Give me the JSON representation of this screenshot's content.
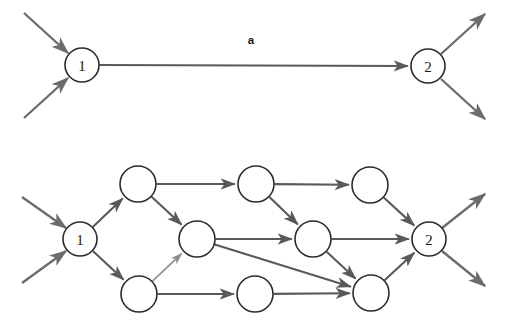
{
  "figure": {
    "background_color": "#ffffff",
    "node_stroke_color": "#2b2b2b",
    "edge_color": "#595959",
    "external_edge_color": "#6b6b6b",
    "faded_edge_color": "#8f8f8f",
    "label_color": "#1a1a1a"
  },
  "panels": [
    {
      "id": "top-panel",
      "name": "coarse-graph",
      "nodes": [
        {
          "id": "t1",
          "label": "1",
          "cx": 82,
          "cy": 65,
          "r": 17
        },
        {
          "id": "t2",
          "label": "2",
          "cx": 428,
          "cy": 66,
          "r": 17
        }
      ],
      "edges": [
        {
          "id": "t-a",
          "from": "t1",
          "to": "t2",
          "label": "a",
          "label_x": 251,
          "label_y": 44,
          "kind": "internal"
        }
      ],
      "external_in": [
        {
          "id": "t-in-1",
          "x1": 24,
          "y1": 13,
          "x2": 68,
          "y2": 53
        },
        {
          "id": "t-in-2",
          "x1": 24,
          "y1": 118,
          "x2": 68,
          "y2": 78
        }
      ],
      "external_out": [
        {
          "id": "t-out-1",
          "x1": 441,
          "y1": 54,
          "x2": 485,
          "y2": 14
        },
        {
          "id": "t-out-2",
          "x1": 441,
          "y1": 79,
          "x2": 485,
          "y2": 119
        }
      ]
    },
    {
      "id": "bottom-panel",
      "name": "refined-graph",
      "nodes": [
        {
          "id": "b1",
          "label": "1",
          "cx": 80,
          "cy": 239,
          "r": 17
        },
        {
          "id": "bu1",
          "label": "",
          "cx": 138,
          "cy": 184,
          "r": 18
        },
        {
          "id": "bu2",
          "label": "",
          "cx": 256,
          "cy": 184,
          "r": 18
        },
        {
          "id": "bu3",
          "label": "",
          "cx": 370,
          "cy": 185,
          "r": 18
        },
        {
          "id": "bm1",
          "label": "",
          "cx": 197,
          "cy": 239,
          "r": 18
        },
        {
          "id": "bm2",
          "label": "",
          "cx": 313,
          "cy": 239,
          "r": 18
        },
        {
          "id": "bl1",
          "label": "",
          "cx": 139,
          "cy": 294,
          "r": 18
        },
        {
          "id": "bl2",
          "label": "",
          "cx": 255,
          "cy": 294,
          "r": 18
        },
        {
          "id": "bl3",
          "label": "",
          "cx": 371,
          "cy": 293,
          "r": 18
        },
        {
          "id": "b2",
          "label": "2",
          "cx": 429,
          "cy": 239,
          "r": 17
        }
      ],
      "edges": [
        {
          "id": "e1",
          "from": "b1",
          "to": "bu1",
          "kind": "internal"
        },
        {
          "id": "e2",
          "from": "b1",
          "to": "bl1",
          "kind": "internal"
        },
        {
          "id": "e3",
          "from": "bu1",
          "to": "bu2",
          "kind": "internal"
        },
        {
          "id": "e4",
          "from": "bu1",
          "to": "bm1",
          "kind": "internal"
        },
        {
          "id": "e5",
          "from": "bu2",
          "to": "bu3",
          "kind": "internal"
        },
        {
          "id": "e6",
          "from": "bu2",
          "to": "bm2",
          "kind": "internal"
        },
        {
          "id": "e7",
          "from": "bu3",
          "to": "b2",
          "kind": "internal"
        },
        {
          "id": "e8",
          "from": "bm1",
          "to": "bm2",
          "kind": "internal"
        },
        {
          "id": "e9",
          "from": "bm1",
          "to": "bl3",
          "kind": "internal"
        },
        {
          "id": "e10",
          "from": "bm2",
          "to": "b2",
          "kind": "internal"
        },
        {
          "id": "e11",
          "from": "bm2",
          "to": "bl3",
          "kind": "internal"
        },
        {
          "id": "e12",
          "from": "bl1",
          "to": "bm1",
          "kind": "faded"
        },
        {
          "id": "e13",
          "from": "bl1",
          "to": "bl2",
          "kind": "internal"
        },
        {
          "id": "e14",
          "from": "bl2",
          "to": "bl3",
          "kind": "internal"
        },
        {
          "id": "e15",
          "from": "bl3",
          "to": "b2",
          "kind": "internal"
        }
      ],
      "external_in": [
        {
          "id": "b-in-1",
          "x1": 22,
          "y1": 197,
          "x2": 66,
          "y2": 228
        },
        {
          "id": "b-in-2",
          "x1": 22,
          "y1": 283,
          "x2": 66,
          "y2": 251
        }
      ],
      "external_out": [
        {
          "id": "b-out-1",
          "x1": 442,
          "y1": 228,
          "x2": 485,
          "y2": 194
        },
        {
          "id": "b-out-2",
          "x1": 442,
          "y1": 251,
          "x2": 485,
          "y2": 286
        }
      ]
    }
  ]
}
